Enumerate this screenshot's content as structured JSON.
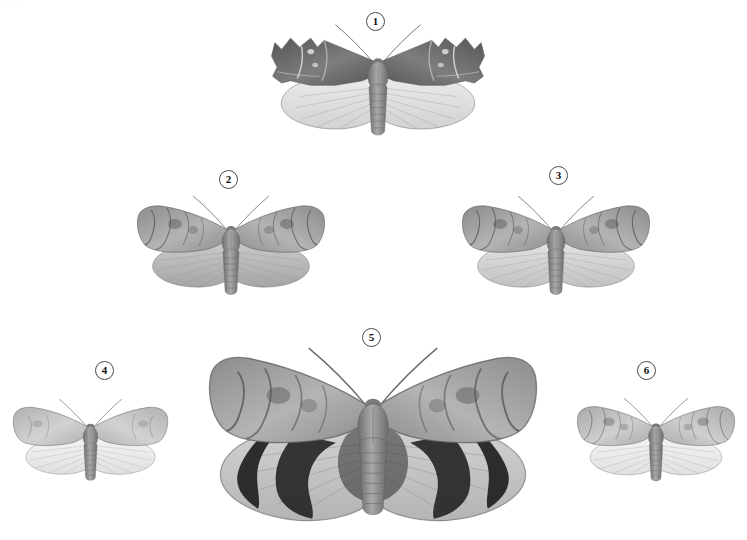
{
  "page": {
    "header_text": "PLATE",
    "background_color": "#ffffff",
    "width": 747,
    "height": 540,
    "type": "field-guide-plate"
  },
  "palette": {
    "ink_dark": "#3d3d3d",
    "ink_black": "#1a1a1a",
    "wing_grey_dark": "#6f6f6f",
    "wing_grey_mid": "#9a9a9a",
    "wing_grey_light": "#c9c9c9",
    "wing_pale": "#dcdcdc",
    "outline": "#5a5a5a",
    "badge_border": "#4a4a4a",
    "badge_text": "#0d0d0d"
  },
  "specimens": [
    {
      "number": "1",
      "badge": {
        "x": 366,
        "y": 12
      },
      "box": {
        "x": 258,
        "y": 18,
        "w": 240,
        "h": 130
      },
      "scale": 1.0,
      "forewing_tone": "dark",
      "hindwing_tone": "pale",
      "description": "large dark moth with scalloped forewing margins and pale hindwings"
    },
    {
      "number": "2",
      "badge": {
        "x": 219,
        "y": 170
      },
      "box": {
        "x": 126,
        "y": 190,
        "w": 210,
        "h": 116
      },
      "scale": 0.86,
      "forewing_tone": "mottled",
      "hindwing_tone": "mid",
      "description": "mottled grey forewings with rounded darker hindwings"
    },
    {
      "number": "3",
      "badge": {
        "x": 549,
        "y": 166
      },
      "box": {
        "x": 452,
        "y": 190,
        "w": 208,
        "h": 116
      },
      "scale": 0.86,
      "forewing_tone": "mottled",
      "hindwing_tone": "light",
      "description": "mottled grey forewings with pale grey hindwings"
    },
    {
      "number": "4",
      "badge": {
        "x": 95,
        "y": 361
      },
      "box": {
        "x": 8,
        "y": 390,
        "w": 165,
        "h": 104
      },
      "scale": 0.7,
      "forewing_tone": "light",
      "hindwing_tone": "very-pale",
      "description": "small pale moth with faint forewing markings"
    },
    {
      "number": "5",
      "badge": {
        "x": 362,
        "y": 328
      },
      "box": {
        "x": 200,
        "y": 338,
        "w": 346,
        "h": 196
      },
      "scale": 1.42,
      "forewing_tone": "mottled",
      "hindwing_tone": "banded",
      "description": "large underwing moth, mottled forewings and dark-banded hindwings"
    },
    {
      "number": "6",
      "badge": {
        "x": 637,
        "y": 361
      },
      "box": {
        "x": 572,
        "y": 390,
        "w": 168,
        "h": 104
      },
      "scale": 0.7,
      "forewing_tone": "speckled",
      "hindwing_tone": "very-pale",
      "description": "small speckled moth with pale hindwings"
    }
  ]
}
